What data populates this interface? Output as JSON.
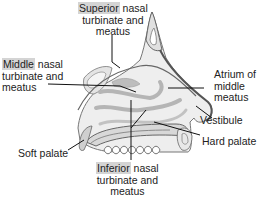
{
  "diagram": {
    "type": "anatomical-sagittal-section",
    "highlight_color": "#d4d4d4",
    "labels": [
      {
        "id": "superior",
        "highlight": "Superior",
        "rest_line1": " nasal",
        "line2": "turbinate and",
        "line3": "meatus"
      },
      {
        "id": "middle",
        "highlight": "Middle",
        "rest_line1": " nasal",
        "line2": "turbinate and",
        "line3": "meatus"
      },
      {
        "id": "inferior",
        "highlight": "Inferior",
        "rest_line1": " nasal",
        "line2": "turbinate and",
        "line3": "meatus"
      },
      {
        "id": "atrium",
        "line1": "Atrium of",
        "line2": "middle",
        "line3": "meatus"
      },
      {
        "id": "vestibule",
        "line1": "Vestibule"
      },
      {
        "id": "hard_palate",
        "line1": "Hard palate"
      },
      {
        "id": "soft_palate",
        "line1": "Soft palate"
      }
    ]
  }
}
